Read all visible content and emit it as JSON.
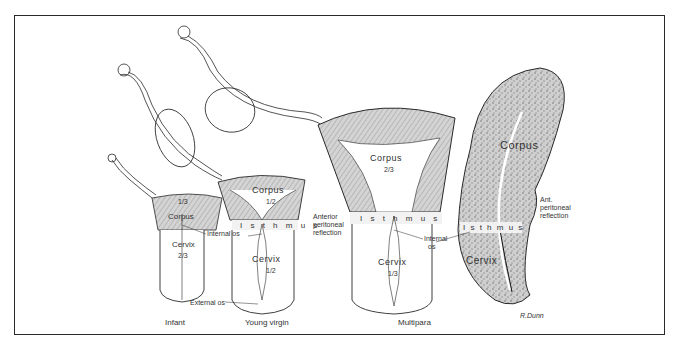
{
  "figure": {
    "panels": [
      {
        "id": "infant",
        "caption": "Infant",
        "corpus_label": "Corpus",
        "corpus_fraction": "1/3",
        "cervix_label": "Cervix",
        "cervix_fraction": "2/3"
      },
      {
        "id": "young-virgin",
        "caption": "Young virgin",
        "corpus_label": "Corpus",
        "corpus_fraction": "1/2",
        "isthmus_label": "I s t h m u s",
        "cervix_label": "Cervix",
        "cervix_fraction": "1/2"
      },
      {
        "id": "multipara",
        "caption": "Multipara",
        "corpus_label": "Corpus",
        "corpus_fraction": "2/3",
        "isthmus_label": "I s t h m u s",
        "cervix_label": "Cervix",
        "cervix_fraction": "1/3"
      },
      {
        "id": "pregnant-section",
        "corpus_label": "Corpus",
        "isthmus_label": "I s t h m u s",
        "cervix_label": "Cervix"
      }
    ],
    "annotations": {
      "internal_os_1": "Internal os",
      "internal_os_2_line1": "Internal",
      "internal_os_2_line2": "os",
      "external_os": "External os",
      "anterior_peritoneal_line1": "Anterior",
      "anterior_peritoneal_line2": "peritoneal",
      "anterior_peritoneal_line3": "reflection",
      "ant_peritoneal_line1": "Ant.",
      "ant_peritoneal_line2": "peritoneal",
      "ant_peritoneal_line3": "reflection"
    },
    "signature": "R.Dunn",
    "colors": {
      "ink": "#2a2a2a",
      "hatch": "#bdbdbd",
      "isthmus_band": "#f2f2f2",
      "paper": "#ffffff"
    }
  }
}
